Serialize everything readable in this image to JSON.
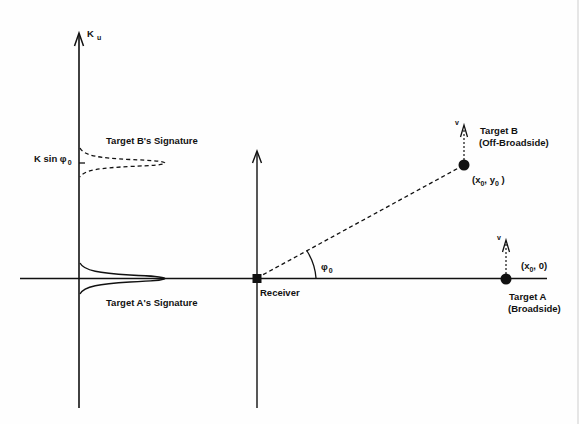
{
  "figure": {
    "type": "geometry diagram",
    "background": "#ffffff",
    "ink_color": "#111111"
  },
  "spectrum_axis": {
    "label_main": "K",
    "label_sub": "u",
    "tick_label_main": "K sin φ",
    "tick_label_sub": "0"
  },
  "signatures": [
    {
      "id": "target-b-signature",
      "label": "Target B's Signature",
      "style": "dashed"
    },
    {
      "id": "target-a-signature",
      "label": "Target A's Signature",
      "style": "solid"
    }
  ],
  "receiver": {
    "label": "Receiver"
  },
  "angle": {
    "label_main": "φ",
    "label_sub": "0"
  },
  "targets": [
    {
      "id": "target-b",
      "name": "Target B",
      "description": "(Off-Broadside)",
      "coord_open": "(x",
      "coord_sub1": "0",
      "coord_mid": ", y",
      "coord_sub2": "0",
      "coord_close": " )",
      "velocity_label": "v"
    },
    {
      "id": "target-a",
      "name": "Target A",
      "description": "(Broadside)",
      "coord_open": "(x",
      "coord_sub1": "0",
      "coord_mid": ", 0)",
      "velocity_label": "v"
    }
  ]
}
